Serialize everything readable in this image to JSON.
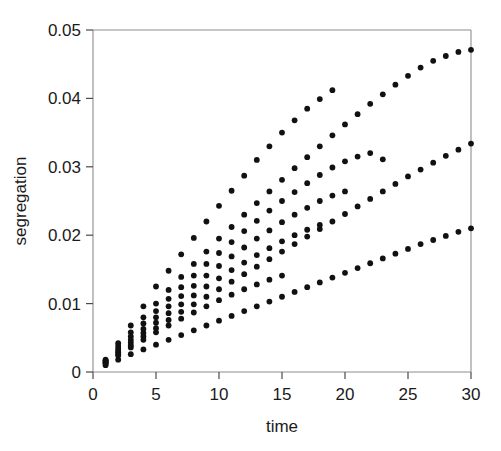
{
  "chart_data": {
    "type": "scatter",
    "title": "",
    "xlabel": "time",
    "ylabel": "segregation",
    "xlim": [
      0,
      30
    ],
    "ylim": [
      0,
      0.05
    ],
    "xticks": [
      0,
      5,
      10,
      15,
      20,
      25,
      30
    ],
    "xtick_labels": [
      "0",
      "5",
      "10",
      "15",
      "20",
      "25",
      "30"
    ],
    "yticks": [
      0,
      0.01,
      0.02,
      0.03,
      0.04,
      0.05
    ],
    "ytick_labels": [
      "0",
      "0.01",
      "0.02",
      "0.03",
      "0.04",
      "0.05"
    ],
    "grid": false,
    "legend": "none",
    "marker": "filled-circle",
    "marker_color": "#111111",
    "marker_size": 5,
    "series": [
      {
        "name": "series-1",
        "x": [
          1,
          2,
          3,
          4,
          5,
          6,
          7,
          8,
          9,
          10,
          11,
          12,
          13,
          14,
          15,
          16,
          17,
          18,
          19
        ],
        "y": [
          0.0018,
          0.0042,
          0.0068,
          0.0096,
          0.0125,
          0.0148,
          0.0172,
          0.0196,
          0.022,
          0.0243,
          0.0265,
          0.0287,
          0.031,
          0.033,
          0.035,
          0.0368,
          0.0385,
          0.0399,
          0.0412
        ]
      },
      {
        "name": "series-2",
        "x": [
          1,
          2,
          3,
          4,
          5,
          6,
          7,
          8,
          9,
          10,
          11,
          12,
          13,
          14,
          15,
          16,
          17,
          18,
          19,
          20,
          21,
          22,
          23,
          24,
          25,
          26,
          27,
          28,
          29,
          30
        ],
        "y": [
          0.0017,
          0.0038,
          0.0058,
          0.008,
          0.01,
          0.012,
          0.0139,
          0.0158,
          0.0176,
          0.0195,
          0.0212,
          0.023,
          0.0247,
          0.0264,
          0.0281,
          0.0298,
          0.0314,
          0.033,
          0.0346,
          0.0362,
          0.0377,
          0.0392,
          0.0406,
          0.042,
          0.0433,
          0.0445,
          0.0455,
          0.0462,
          0.0468,
          0.0471
        ]
      },
      {
        "name": "series-3",
        "x": [
          1,
          2,
          3,
          4,
          5,
          6,
          7,
          8,
          9,
          10,
          11,
          12,
          13,
          14,
          15,
          16,
          17,
          18,
          19,
          20,
          21,
          22,
          23
        ],
        "y": [
          0.0016,
          0.0034,
          0.0052,
          0.0071,
          0.0089,
          0.0107,
          0.0124,
          0.0141,
          0.0158,
          0.0174,
          0.019,
          0.0206,
          0.0221,
          0.0236,
          0.025,
          0.0263,
          0.0276,
          0.0288,
          0.0299,
          0.0308,
          0.0315,
          0.032,
          0.0311
        ]
      },
      {
        "name": "series-4",
        "x": [
          1,
          2,
          3,
          4,
          5,
          6,
          7,
          8,
          9,
          10,
          11,
          12,
          13,
          14,
          15,
          16,
          17,
          18,
          19,
          20
        ],
        "y": [
          0.0015,
          0.0031,
          0.0047,
          0.0063,
          0.008,
          0.0096,
          0.0111,
          0.0126,
          0.0141,
          0.0155,
          0.0169,
          0.0182,
          0.0195,
          0.0207,
          0.0219,
          0.023,
          0.024,
          0.025,
          0.0258,
          0.0264
        ]
      },
      {
        "name": "series-5",
        "x": [
          1,
          2,
          3,
          4,
          5,
          6,
          7,
          8,
          9,
          10,
          11,
          12,
          13,
          14,
          15,
          16,
          17,
          18
        ],
        "y": [
          0.0014,
          0.0029,
          0.0043,
          0.0057,
          0.0072,
          0.0086,
          0.0099,
          0.0112,
          0.0125,
          0.0137,
          0.0149,
          0.016,
          0.0171,
          0.0181,
          0.0191,
          0.02,
          0.0208,
          0.0215
        ]
      },
      {
        "name": "series-6",
        "x": [
          1,
          2,
          3,
          4,
          5,
          6,
          7,
          8,
          9,
          10,
          11,
          12,
          13,
          14,
          15,
          16,
          17,
          18,
          19,
          20,
          21,
          22,
          23,
          24,
          25,
          26,
          27,
          28,
          29,
          30
        ],
        "y": [
          0.0013,
          0.0026,
          0.0039,
          0.0052,
          0.0064,
          0.0076,
          0.0088,
          0.0099,
          0.011,
          0.0121,
          0.0132,
          0.0143,
          0.0154,
          0.0165,
          0.0176,
          0.0187,
          0.0198,
          0.0209,
          0.022,
          0.0231,
          0.0242,
          0.0253,
          0.0264,
          0.0275,
          0.0286,
          0.0296,
          0.0306,
          0.0316,
          0.0325,
          0.0334
        ]
      },
      {
        "name": "series-7",
        "x": [
          1,
          2,
          3,
          4,
          5,
          6,
          7,
          8,
          9,
          10,
          11,
          12,
          13,
          14,
          15
        ],
        "y": [
          0.0012,
          0.0024,
          0.0036,
          0.0047,
          0.0058,
          0.0068,
          0.0078,
          0.0087,
          0.0096,
          0.0105,
          0.0113,
          0.0121,
          0.0128,
          0.0135,
          0.0141
        ]
      },
      {
        "name": "series-8",
        "x": [
          1,
          2,
          3,
          4,
          5,
          6,
          7,
          8,
          9,
          10,
          11,
          12,
          13,
          14,
          15,
          16,
          17,
          18,
          19,
          20,
          21,
          22,
          23,
          24,
          25,
          26,
          27,
          28,
          29,
          30
        ],
        "y": [
          0.001,
          0.0018,
          0.0026,
          0.0033,
          0.004,
          0.0047,
          0.0054,
          0.0061,
          0.0068,
          0.0075,
          0.0082,
          0.0089,
          0.0096,
          0.0103,
          0.011,
          0.0117,
          0.0124,
          0.0131,
          0.0138,
          0.0145,
          0.0152,
          0.0159,
          0.0166,
          0.0173,
          0.018,
          0.0187,
          0.0193,
          0.0199,
          0.0205,
          0.021
        ]
      }
    ]
  }
}
